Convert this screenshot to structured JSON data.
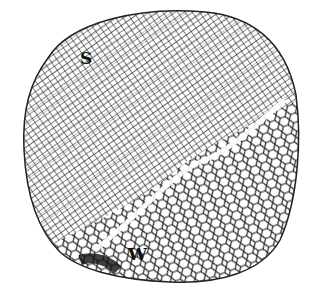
{
  "figure": {
    "labels": {
      "s": "S",
      "w": "W"
    },
    "colors": {
      "background": "#ffffff",
      "cell_wall": "#1a1a1a"
    }
  }
}
